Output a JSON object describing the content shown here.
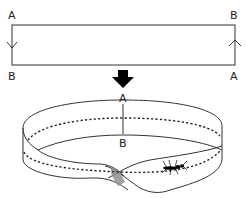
{
  "strip": {
    "corner_top_left": "A",
    "corner_top_right": "B",
    "corner_bottom_left": "B",
    "corner_bottom_right": "A",
    "left_edge_arrow": "down",
    "right_edge_arrow": "up"
  },
  "transform_arrow": "down",
  "band": {
    "label_top": "A",
    "label_bottom": "B",
    "description": "Möbius strip with dotted center line and an ant walking along it"
  },
  "colors": {
    "line": "#333333",
    "shade": "#8a8a8a",
    "arrow": "#000000"
  }
}
